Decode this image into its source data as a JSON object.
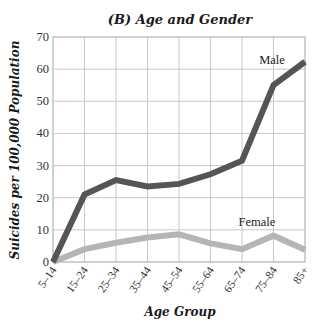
{
  "chart_data": {
    "type": "line",
    "title": "(B) Age and Gender",
    "xlabel": "Age Group",
    "ylabel": "Suicides per 100,000 Population",
    "categories": [
      "5–14",
      "15–24",
      "25–34",
      "35–44",
      "45–54",
      "55–64",
      "65–74",
      "75–84",
      "85+"
    ],
    "ylim": [
      0,
      70
    ],
    "yticks": [
      0,
      10,
      20,
      30,
      40,
      50,
      60,
      70
    ],
    "grid": true,
    "legend": "inline labels",
    "series": [
      {
        "name": "Male",
        "color": "#555555",
        "values": [
          0,
          21,
          25.5,
          23.5,
          24.3,
          27.3,
          31.5,
          55,
          62.3
        ]
      },
      {
        "name": "Female",
        "color": "#b5b5b5",
        "values": [
          0,
          4,
          6,
          7.6,
          8.6,
          5.8,
          4,
          8.2,
          3.8
        ]
      }
    ]
  }
}
